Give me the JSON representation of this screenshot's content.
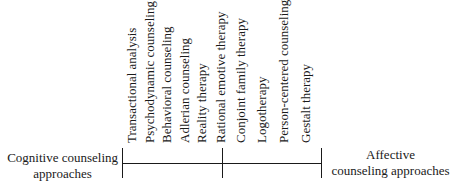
{
  "diagram": {
    "type": "continuum",
    "left_end": {
      "line1": "Cognitive counseling",
      "line2": "approaches"
    },
    "right_end": {
      "line1": "Affective",
      "line2": "counseling approaches"
    },
    "approaches": [
      "Transactional analysis",
      "Psychodynamic counseling",
      "Behavioral counseling",
      "Adlerian counseling",
      "Reality therapy",
      "Rational emotive therapy",
      "Conjoint family therapy",
      "Logotherapy",
      "Person-centered counseling",
      "Gestalt therapy"
    ]
  }
}
